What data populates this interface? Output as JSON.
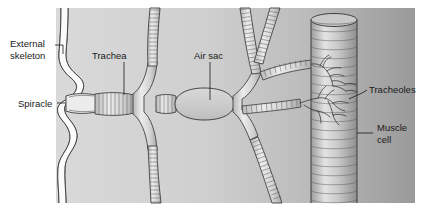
{
  "figure": {
    "width": 423,
    "height": 215,
    "background_color": "#ffffff"
  },
  "colors": {
    "body_light": "#d6d6d6",
    "body_mid": "#c3c3c3",
    "body_dark": "#9c9c9c",
    "outline": "#3a3a3a",
    "label_text": "#1a1a1a",
    "tube_fill": "#e4e4e4",
    "muscle_fill": "#cfcfcf"
  },
  "labels": [
    {
      "id": "external-skeleton",
      "text_line1": "External",
      "text_line2": "skeleton",
      "x": 10,
      "y": 44
    },
    {
      "id": "trachea",
      "text": "Trachea",
      "x": 92,
      "y": 56
    },
    {
      "id": "air-sac",
      "text": "Air sac",
      "x": 194,
      "y": 56
    },
    {
      "id": "spiracle",
      "text": "Spiracle",
      "x": 18,
      "y": 104
    },
    {
      "id": "tracheoles",
      "text": "Tracheoles",
      "x": 369,
      "y": 90
    },
    {
      "id": "muscle-cell",
      "text_line1": "Muscle",
      "text_line2": "cell",
      "x": 377,
      "y": 133
    }
  ],
  "structures": [
    {
      "id": "external-skeleton",
      "name": "External skeleton",
      "kind": "wavy-wall"
    },
    {
      "id": "spiracle",
      "name": "Spiracle",
      "kind": "opening"
    },
    {
      "id": "trachea-main",
      "name": "Trachea",
      "kind": "ringed-tube"
    },
    {
      "id": "air-sac",
      "name": "Air sac",
      "kind": "smooth-sac"
    },
    {
      "id": "tracheoles",
      "name": "Tracheoles",
      "kind": "fine-branches"
    },
    {
      "id": "muscle-cell",
      "name": "Muscle cell",
      "kind": "striated-cylinder"
    }
  ]
}
